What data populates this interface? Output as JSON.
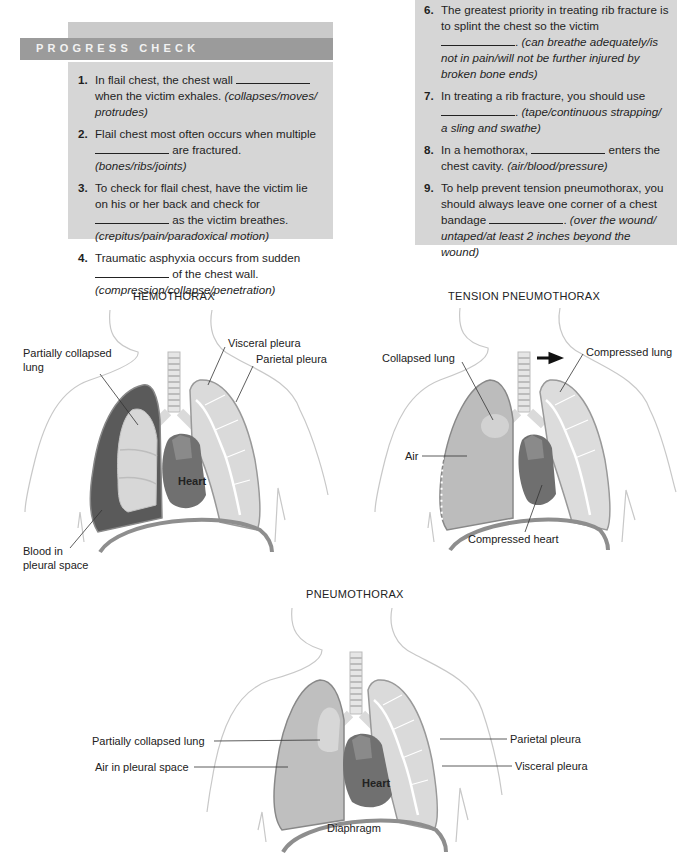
{
  "progress_check": {
    "header": "PROGRESS CHECK",
    "questions_left": [
      {
        "num": "1.",
        "pre": "In flail chest, the chest wall",
        "post": "when the victim exhales.",
        "options": "(collapses/moves/ protrudes)"
      },
      {
        "num": "2.",
        "pre": "Flail chest most often occurs when multiple",
        "post": "are fractured.",
        "options": "(bones/ribs/joints)"
      },
      {
        "num": "3.",
        "pre": "To check for flail chest, have the victim lie on his or her back and check for",
        "post": "as the victim breathes.",
        "options": "(crepitus/pain/paradoxical motion)"
      },
      {
        "num": "4.",
        "pre": "Traumatic asphyxia occurs from sudden",
        "post": "of the chest wall.",
        "options": "(compression/collapse/penetration)"
      }
    ],
    "questions_right": [
      {
        "num": "6.",
        "pre": "The greatest priority in treating rib fracture is to splint the chest so the victim",
        "post": ".",
        "options": "(can breathe adequately/is not in pain/will not be further injured by broken bone ends)"
      },
      {
        "num": "7.",
        "pre": "In treating a rib fracture, you should use",
        "post": ".",
        "options": "(tape/continuous strapping/ a sling and swathe)"
      },
      {
        "num": "8.",
        "pre": "In a hemothorax,",
        "post": "enters the chest cavity.",
        "options": "(air/blood/pressure)"
      },
      {
        "num": "9.",
        "pre": "To help prevent tension pneumothorax, you should always leave one corner of a chest bandage",
        "post": ".",
        "options": "(over the wound/ untaped/at least 2 inches beyond the wound)"
      }
    ]
  },
  "figures": {
    "hemothorax": {
      "title": "HEMOTHORAX",
      "labels": {
        "partially_collapsed_1": "Partially collapsed",
        "partially_collapsed_2": "lung",
        "visceral": "Visceral pleura",
        "parietal": "Parietal pleura",
        "heart": "Heart",
        "blood_1": "Blood in",
        "blood_2": "pleural space"
      }
    },
    "tension": {
      "title": "TENSION PNEUMOTHORAX",
      "labels": {
        "collapsed": "Collapsed lung",
        "compressed_lung": "Compressed lung",
        "air": "Air",
        "compressed_heart": "Compressed heart"
      },
      "arrow": "right-arrow"
    },
    "pneumothorax": {
      "title": "PNEUMOTHORAX",
      "labels": {
        "partially_collapsed": "Partially collapsed lung",
        "air_pleural": "Air in pleural space",
        "parietal": "Parietal pleura",
        "visceral": "Visceral pleura",
        "heart": "Heart",
        "diaphragm": "Diaphragm"
      }
    }
  },
  "colors": {
    "box_bg": "#d6d6d6",
    "header_bg": "#9b9b9b",
    "blood": "#5a5a5a",
    "lung_light": "#d8d8d8",
    "air": "#bdbdbd",
    "heart": "#6f6f6f"
  }
}
